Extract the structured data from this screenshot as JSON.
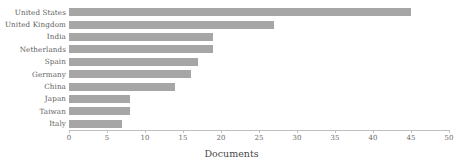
{
  "chart_data": {
    "type": "bar",
    "orientation": "horizontal",
    "title": "",
    "xlabel": "Documents",
    "ylabel": "",
    "xlim": [
      0,
      50
    ],
    "xticks": [
      0,
      5,
      10,
      15,
      20,
      25,
      30,
      35,
      40,
      45,
      50
    ],
    "grid": false,
    "legend": null,
    "bar_color": "#a6a6a6",
    "axis_color": "#bfbfbf",
    "label_color": "#5d5d5d",
    "categories": [
      "United States",
      "United Kingdom",
      "India",
      "Netherlands",
      "Spain",
      "Germany",
      "China",
      "Japan",
      "Taiwan",
      "Italy"
    ],
    "values": [
      45,
      27,
      19,
      19,
      17,
      16,
      14,
      8,
      8,
      7
    ]
  }
}
